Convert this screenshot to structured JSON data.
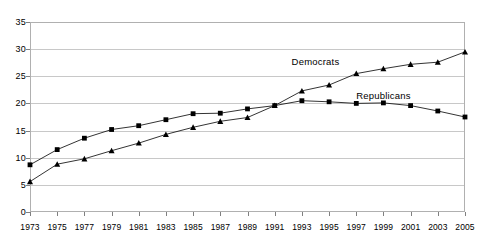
{
  "chart_data": {
    "type": "line",
    "title": "",
    "xlabel": "",
    "ylabel": "",
    "x": [
      1973,
      1975,
      1977,
      1979,
      1981,
      1983,
      1985,
      1987,
      1989,
      1991,
      1993,
      1995,
      1997,
      1999,
      2001,
      2003,
      2005
    ],
    "categories": [
      "1973",
      "1975",
      "1977",
      "1979",
      "1981",
      "1983",
      "1985",
      "1987",
      "1989",
      "1991",
      "1993",
      "1995",
      "1997",
      "1999",
      "2001",
      "2003",
      "2005"
    ],
    "series": [
      {
        "name": "Democrats",
        "marker": "triangle",
        "color": "#000000",
        "values": [
          5.6,
          8.8,
          9.8,
          11.3,
          12.7,
          14.3,
          15.6,
          16.7,
          17.4,
          19.6,
          22.3,
          23.4,
          25.5,
          26.4,
          27.2,
          27.6,
          29.5
        ]
      },
      {
        "name": "Republicans",
        "marker": "square",
        "color": "#000000",
        "values": [
          8.7,
          11.5,
          13.6,
          15.2,
          15.9,
          17.0,
          18.1,
          18.2,
          19.0,
          19.6,
          20.5,
          20.3,
          20.0,
          20.1,
          19.6,
          18.6,
          17.5
        ]
      }
    ],
    "ylim": [
      0,
      35
    ],
    "ytick_values": [
      0,
      5,
      10,
      15,
      20,
      25,
      30,
      35
    ],
    "ytick_labels": [
      "0",
      "5",
      "10",
      "15",
      "20",
      "25",
      "30",
      "35"
    ],
    "xlim": [
      1973,
      2005
    ],
    "grid": "horizontal",
    "legend": "inline-annotations",
    "annotations": [
      {
        "text": "Democrats",
        "x": 1994,
        "y": 27.8
      },
      {
        "text": "Republicans",
        "x": 1999,
        "y": 21.6
      }
    ]
  }
}
